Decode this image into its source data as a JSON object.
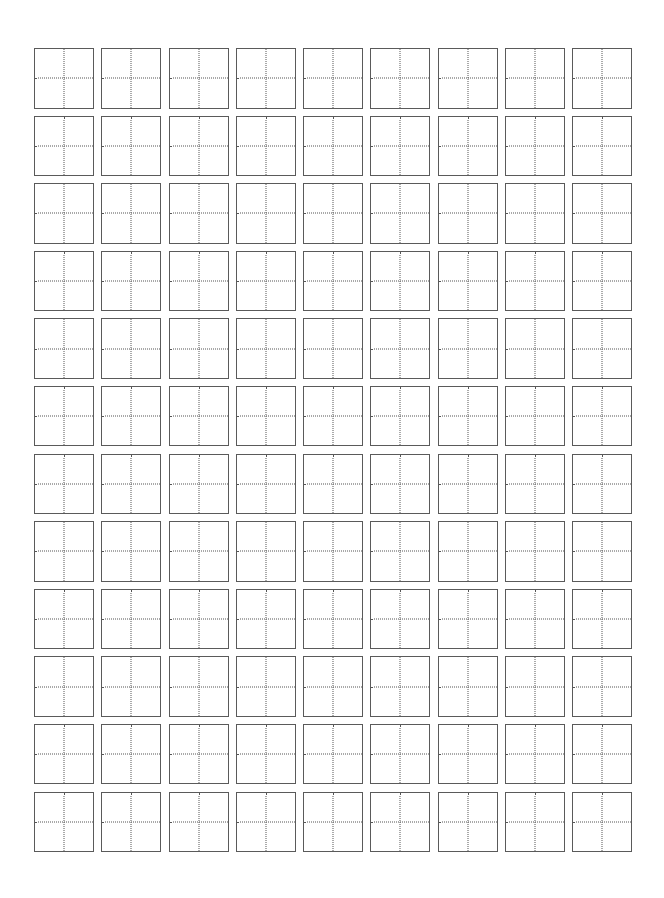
{
  "page": {
    "type": "tianzige-practice-sheet",
    "background_color": "#ffffff",
    "border_color": "#5a5a5a",
    "guide_line_color": "#555555",
    "guide_line_style": "dotted"
  },
  "grid": {
    "rows": 12,
    "columns": 9,
    "cell_contents": []
  }
}
